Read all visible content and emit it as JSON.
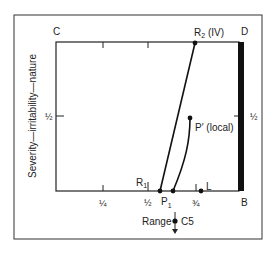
{
  "diagram": {
    "corners": {
      "top_left": "C",
      "top_right": "D",
      "bottom_right": "B"
    },
    "y_axis_label": "Severity—irritability—nature",
    "y_ticks": {
      "left_half": "½",
      "right_half": "½"
    },
    "x_ticks": [
      "¼",
      "½",
      "¾"
    ],
    "x_axis_label": "Range",
    "movement": "C5",
    "points": {
      "R1": {
        "label": "R",
        "sub": "1"
      },
      "R2": {
        "label": "R",
        "sub": "2",
        "suffix": " (IV)"
      },
      "P1": {
        "label": "P",
        "sub": "1"
      },
      "P_prime": {
        "label": "P′ (local)"
      },
      "L": {
        "label": "L"
      }
    },
    "colors": {
      "ink": "#222222",
      "background": "#ffffff"
    }
  }
}
